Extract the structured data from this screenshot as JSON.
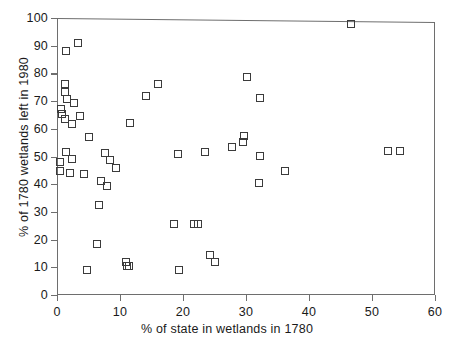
{
  "chart_data": {
    "type": "scatter",
    "title": "",
    "xlabel": "% of state in wetlands in 1780",
    "ylabel": "% of 1780 wetlands left in 1980",
    "xlim": [
      0,
      60
    ],
    "ylim": [
      0,
      100
    ],
    "xticks": [
      0,
      10,
      20,
      30,
      40,
      50,
      60
    ],
    "yticks": [
      0,
      10,
      20,
      30,
      40,
      50,
      60,
      70,
      80,
      90,
      100
    ],
    "grid": false,
    "legend": null,
    "marker": "open-square",
    "marker_color": "#3b3b3b",
    "n_points": 50,
    "points": [
      {
        "x": 1.5,
        "y": 88.0
      },
      {
        "x": 3.4,
        "y": 90.8
      },
      {
        "x": 1.2,
        "y": 76.2
      },
      {
        "x": 1.3,
        "y": 73.3
      },
      {
        "x": 1.6,
        "y": 70.6
      },
      {
        "x": 2.7,
        "y": 69.2
      },
      {
        "x": 0.7,
        "y": 67.0
      },
      {
        "x": 0.8,
        "y": 65.4
      },
      {
        "x": 1.3,
        "y": 63.5
      },
      {
        "x": 3.6,
        "y": 64.5
      },
      {
        "x": 2.4,
        "y": 61.6
      },
      {
        "x": 5.0,
        "y": 57.0
      },
      {
        "x": 1.4,
        "y": 51.8
      },
      {
        "x": 0.4,
        "y": 48.0
      },
      {
        "x": 2.4,
        "y": 49.0
      },
      {
        "x": 0.5,
        "y": 44.6
      },
      {
        "x": 2.0,
        "y": 44.0
      },
      {
        "x": 4.3,
        "y": 43.6
      },
      {
        "x": 7.0,
        "y": 41.0
      },
      {
        "x": 8.0,
        "y": 39.2
      },
      {
        "x": 6.6,
        "y": 32.5
      },
      {
        "x": 6.4,
        "y": 18.4
      },
      {
        "x": 4.7,
        "y": 8.9
      },
      {
        "x": 10.9,
        "y": 11.9
      },
      {
        "x": 11.4,
        "y": 10.3
      },
      {
        "x": 11.1,
        "y": 10.5
      },
      {
        "x": 7.6,
        "y": 51.2
      },
      {
        "x": 9.4,
        "y": 45.8
      },
      {
        "x": 8.4,
        "y": 48.6
      },
      {
        "x": 11.6,
        "y": 62.0
      },
      {
        "x": 14.1,
        "y": 71.8
      },
      {
        "x": 19.4,
        "y": 8.9
      },
      {
        "x": 18.6,
        "y": 25.6
      },
      {
        "x": 16.0,
        "y": 76.0
      },
      {
        "x": 19.2,
        "y": 50.9
      },
      {
        "x": 21.8,
        "y": 25.8
      },
      {
        "x": 24.3,
        "y": 14.3
      },
      {
        "x": 25.0,
        "y": 11.8
      },
      {
        "x": 23.5,
        "y": 51.8
      },
      {
        "x": 22.4,
        "y": 25.8
      },
      {
        "x": 27.8,
        "y": 53.3
      },
      {
        "x": 29.7,
        "y": 57.4
      },
      {
        "x": 29.5,
        "y": 55.2
      },
      {
        "x": 30.2,
        "y": 78.6
      },
      {
        "x": 32.2,
        "y": 71.2
      },
      {
        "x": 32.3,
        "y": 50.2
      },
      {
        "x": 32.0,
        "y": 40.3
      },
      {
        "x": 36.2,
        "y": 44.7
      },
      {
        "x": 46.6,
        "y": 98.0
      },
      {
        "x": 52.6,
        "y": 52.0
      },
      {
        "x": 54.5,
        "y": 52.0
      }
    ]
  }
}
